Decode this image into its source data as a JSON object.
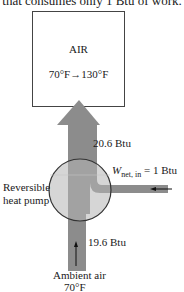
{
  "caption": "that consumes only 1 Btu of work.",
  "box": {
    "title": "AIR",
    "temperature_change": "70°F→130°F"
  },
  "heat_out": {
    "label": "20.6 Btu"
  },
  "work_in": {
    "symbol": "W",
    "subscript": "net, in",
    "value": "= 1 Btu"
  },
  "device": {
    "line1": "Reversible",
    "line2": "heat pump"
  },
  "heat_in": {
    "label": "19.6 Btu"
  },
  "source": {
    "line1": "Ambient air",
    "line2": "70°F"
  },
  "colors": {
    "flow_gray": "#8c8c8c",
    "circle_fill": "#a9a9a9",
    "outline": "#333333"
  }
}
